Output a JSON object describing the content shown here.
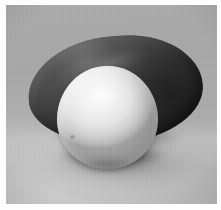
{
  "image": {
    "title": "Still life: white egg and dark gourd",
    "medium": "photograph",
    "color_mode": "grayscale",
    "width_px": 221,
    "height_px": 210,
    "border": {
      "present": true,
      "color": "#fdfdfd",
      "thickness_px": 5
    },
    "background": {
      "name": "studio-backdrop",
      "description": "flat gray seamless surface with soft gradient, brighter toward lower left",
      "color_top": "#a8a8a8",
      "color_bottom": "#b4b4b4"
    },
    "subjects": [
      {
        "id": "gourd",
        "label": "dark elongated gourd",
        "shape": "elongated oval",
        "color": "#2e2e2e",
        "highlight_color": "#6a6a6a",
        "position": "behind, spanning left to right",
        "rotation_deg": -5
      },
      {
        "id": "egg",
        "label": "white egg",
        "shape": "ovoid sphere",
        "color": "#f3f1ec",
        "shade_color": "#bdb8ae",
        "position": "front center, slightly left of center",
        "highlight": "upper left"
      }
    ],
    "shadows": [
      {
        "id": "gourd-cast-shadow",
        "label": "gourd cast shadow",
        "color": "#3c3c3c",
        "direction": "right and downward"
      },
      {
        "id": "egg-contact-shadow",
        "label": "egg contact shadow",
        "color": "#141414",
        "direction": "below and slightly right"
      }
    ],
    "lighting": {
      "key_light": "upper left, diffuse",
      "fill": "soft bounce from lower left"
    }
  }
}
